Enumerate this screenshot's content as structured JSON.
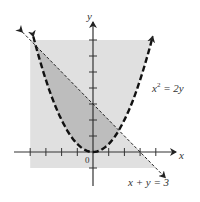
{
  "figure": {
    "axes": {
      "x_label": "x",
      "y_label": "y",
      "origin_label": "0",
      "x_ticks": [
        -4,
        -3,
        -2,
        -1,
        1,
        2,
        3,
        4
      ],
      "y_ticks": [
        -1,
        1,
        2,
        3,
        4,
        5,
        6,
        7
      ],
      "x_range": [
        -4,
        4
      ],
      "y_range": [
        -1,
        7
      ]
    },
    "curves": [
      {
        "name": "parabola",
        "equation_base": "x",
        "equation_sup": "2",
        "equation_rest": " = 2y",
        "style": "dashed-bold"
      },
      {
        "name": "line",
        "equation": "x + y = 3",
        "style": "dashed-thin"
      }
    ],
    "regions": {
      "light": "union of y ≥ x²/2 and x + y ≤ 3 within window",
      "dark": "intersection: x²/2 ≤ y ≤ 3 − x"
    },
    "intersections": [
      [
        -3.65,
        6.65
      ],
      [
        1.65,
        1.35
      ]
    ],
    "colors": {
      "light_fill": "#e0e0e0",
      "dark_fill": "#bdbdbd",
      "ink": "#222222"
    }
  }
}
